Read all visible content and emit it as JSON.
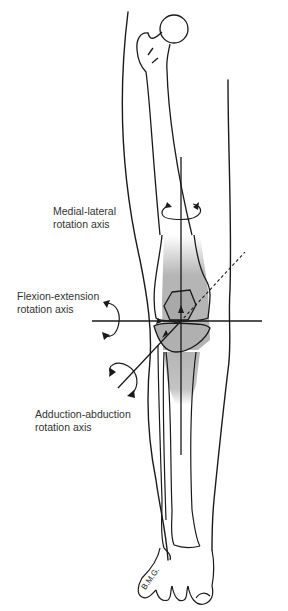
{
  "figure": {
    "shading_color": "#b5b5b5",
    "line_color": "#1a1a1a"
  },
  "labels": {
    "medial_lateral": {
      "line1": "Medial-lateral",
      "line2": "rotation axis"
    },
    "flexion_extension": {
      "line1": "Flexion-extension",
      "line2": "rotation axis"
    },
    "adduction_abduction": {
      "line1": "Adduction-abduction",
      "line2": "rotation axis"
    }
  },
  "signature": "B.M.G."
}
